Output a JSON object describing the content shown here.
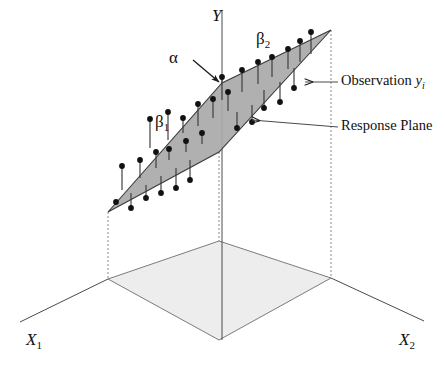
{
  "figure": {
    "type": "3d-regression-plane-schematic",
    "background_color": "#ffffff",
    "stroke_color": "#444444",
    "plane_fill": "#a9a9a9",
    "floor_fill": "#ededed",
    "point_color": "#111111"
  },
  "axes": {
    "y_label": "Y",
    "x1_label": "X",
    "x1_sub": "1",
    "x2_label": "X",
    "x2_sub": "2"
  },
  "parameters": {
    "intercept": "α",
    "slope1": "β",
    "slope1_sub": "1",
    "slope2": "β",
    "slope2_sub": "2"
  },
  "callouts": {
    "observation_prefix": "Observation ",
    "observation_var": "y",
    "observation_sub": "i",
    "response_plane": "Response Plane"
  },
  "chart_data": {
    "type": "scatter",
    "title": "",
    "xlabel": "X1",
    "ylabel": "Y",
    "zlabel": "X2",
    "plane_vertices": [
      [
        108,
        212
      ],
      [
        222,
        83
      ],
      [
        331,
        30
      ],
      [
        219,
        152
      ]
    ],
    "floor_vertices": [
      [
        108,
        279
      ],
      [
        219,
        241
      ],
      [
        331,
        278
      ],
      [
        219,
        340
      ]
    ],
    "observations": [
      {
        "x": 116,
        "y": 202,
        "stem_to": 204
      },
      {
        "x": 131,
        "y": 208,
        "stem_to": 193
      },
      {
        "x": 146,
        "y": 198,
        "stem_to": 185
      },
      {
        "x": 161,
        "y": 193,
        "stem_to": 176
      },
      {
        "x": 176,
        "y": 188,
        "stem_to": 168
      },
      {
        "x": 190,
        "y": 180,
        "stem_to": 160
      },
      {
        "x": 122,
        "y": 166,
        "stem_to": 190
      },
      {
        "x": 140,
        "y": 160,
        "stem_to": 178
      },
      {
        "x": 156,
        "y": 152,
        "stem_to": 168
      },
      {
        "x": 169,
        "y": 149,
        "stem_to": 160
      },
      {
        "x": 186,
        "y": 141,
        "stem_to": 152
      },
      {
        "x": 202,
        "y": 133,
        "stem_to": 144
      },
      {
        "x": 150,
        "y": 119,
        "stem_to": 148
      },
      {
        "x": 168,
        "y": 112,
        "stem_to": 140
      },
      {
        "x": 183,
        "y": 118,
        "stem_to": 133
      },
      {
        "x": 198,
        "y": 104,
        "stem_to": 126
      },
      {
        "x": 213,
        "y": 99,
        "stem_to": 118
      },
      {
        "x": 228,
        "y": 92,
        "stem_to": 111
      },
      {
        "x": 237,
        "y": 128,
        "stem_to": 112
      },
      {
        "x": 252,
        "y": 122,
        "stem_to": 105
      },
      {
        "x": 222,
        "y": 77,
        "stem_to": 100
      },
      {
        "x": 242,
        "y": 70,
        "stem_to": 92
      },
      {
        "x": 258,
        "y": 62,
        "stem_to": 84
      },
      {
        "x": 272,
        "y": 57,
        "stem_to": 77
      },
      {
        "x": 288,
        "y": 49,
        "stem_to": 69
      },
      {
        "x": 264,
        "y": 108,
        "stem_to": 90
      },
      {
        "x": 280,
        "y": 102,
        "stem_to": 82
      },
      {
        "x": 300,
        "y": 41,
        "stem_to": 62
      },
      {
        "x": 311,
        "y": 32,
        "stem_to": 54
      },
      {
        "x": 294,
        "y": 88,
        "stem_to": 68
      }
    ]
  }
}
